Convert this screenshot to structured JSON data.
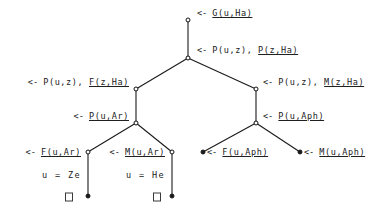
{
  "diagram": {
    "stroke_color": "#1a1a1a",
    "text_color": "#202020",
    "background": "#ffffff",
    "arrow_symbol": "<-",
    "empty_clause_symbol": "box",
    "nodes": [
      {
        "id": "n0",
        "x": 188,
        "y": 20,
        "style": "open",
        "label_side": "right",
        "label_x": 197,
        "label_y": 13,
        "goal_prefix": "<- ",
        "literals": [
          {
            "text": "G(u,Ha)",
            "selected": true
          }
        ]
      },
      {
        "id": "n1",
        "x": 188,
        "y": 58,
        "style": "open",
        "label_side": "right",
        "label_x": 197,
        "label_y": 50,
        "goal_prefix": "<- ",
        "literals": [
          {
            "text": "P(u,z), ",
            "selected": false
          },
          {
            "text": "P(z,Ha)",
            "selected": true
          }
        ]
      },
      {
        "id": "n2",
        "x": 136,
        "y": 89,
        "style": "open",
        "label_side": "left",
        "label_x": 129,
        "label_y": 82,
        "goal_prefix": "<- ",
        "literals": [
          {
            "text": "P(u,z), ",
            "selected": false
          },
          {
            "text": "F(z,Ha)",
            "selected": true
          }
        ]
      },
      {
        "id": "n3",
        "x": 256,
        "y": 89,
        "style": "open",
        "label_side": "right",
        "label_x": 263,
        "label_y": 82,
        "goal_prefix": "<- ",
        "literals": [
          {
            "text": "P(u,z), ",
            "selected": false
          },
          {
            "text": "M(z,Ha)",
            "selected": true
          }
        ]
      },
      {
        "id": "n4",
        "x": 136,
        "y": 123,
        "style": "open",
        "label_side": "left",
        "label_x": 129,
        "label_y": 116,
        "goal_prefix": "<- ",
        "literals": [
          {
            "text": "P(u,Ar)",
            "selected": true
          }
        ]
      },
      {
        "id": "n5",
        "x": 256,
        "y": 123,
        "style": "open",
        "label_side": "right",
        "label_x": 263,
        "label_y": 116,
        "goal_prefix": "<- ",
        "literals": [
          {
            "text": "P(u,Aph)",
            "selected": true
          }
        ]
      },
      {
        "id": "n6",
        "x": 88,
        "y": 152,
        "style": "open",
        "label_side": "left",
        "label_x": 81,
        "label_y": 152,
        "goal_prefix": "<- ",
        "literals": [
          {
            "text": "F(u,Ar)",
            "selected": true
          }
        ]
      },
      {
        "id": "n7",
        "x": 172,
        "y": 152,
        "style": "open",
        "label_side": "left",
        "label_x": 165,
        "label_y": 152,
        "goal_prefix": "<- ",
        "literals": [
          {
            "text": "M(u,Ar)",
            "selected": true
          }
        ]
      },
      {
        "id": "n8",
        "x": 203,
        "y": 152,
        "style": "filled",
        "label_side": "right",
        "label_x": 207,
        "label_y": 152,
        "goal_prefix": "<- ",
        "literals": [
          {
            "text": "F(u,Aph)",
            "selected": true
          }
        ]
      },
      {
        "id": "n9",
        "x": 300,
        "y": 152,
        "style": "filled",
        "label_side": "right",
        "label_x": 304,
        "label_y": 152,
        "goal_prefix": "<- ",
        "literals": [
          {
            "text": "M(u,Aph)",
            "selected": true
          }
        ]
      },
      {
        "id": "n10",
        "x": 88,
        "y": 196,
        "style": "filled",
        "label_side": "none",
        "label_x": 0,
        "label_y": 0,
        "goal_prefix": "",
        "literals": []
      },
      {
        "id": "n11",
        "x": 172,
        "y": 196,
        "style": "filled",
        "label_side": "none",
        "label_x": 0,
        "label_y": 0,
        "goal_prefix": "",
        "literals": []
      }
    ],
    "edges": [
      {
        "from": "n0",
        "to": "n1",
        "x1": 188,
        "y1": 20,
        "x2": 188,
        "y2": 58
      },
      {
        "from": "n1",
        "to": "n2",
        "x1": 188,
        "y1": 58,
        "x2": 136,
        "y2": 89
      },
      {
        "from": "n1",
        "to": "n3",
        "x1": 188,
        "y1": 58,
        "x2": 256,
        "y2": 89
      },
      {
        "from": "n2",
        "to": "n4",
        "x1": 136,
        "y1": 89,
        "x2": 136,
        "y2": 123
      },
      {
        "from": "n3",
        "to": "n5",
        "x1": 256,
        "y1": 89,
        "x2": 256,
        "y2": 123
      },
      {
        "from": "n4",
        "to": "n6",
        "x1": 136,
        "y1": 123,
        "x2": 88,
        "y2": 152
      },
      {
        "from": "n4",
        "to": "n7",
        "x1": 136,
        "y1": 123,
        "x2": 172,
        "y2": 152
      },
      {
        "from": "n5",
        "to": "n8",
        "x1": 256,
        "y1": 123,
        "x2": 203,
        "y2": 152
      },
      {
        "from": "n5",
        "to": "n9",
        "x1": 256,
        "y1": 123,
        "x2": 300,
        "y2": 152
      },
      {
        "from": "n6",
        "to": "n10",
        "x1": 88,
        "y1": 152,
        "x2": 88,
        "y2": 196
      },
      {
        "from": "n7",
        "to": "n11",
        "x1": 172,
        "y1": 152,
        "x2": 172,
        "y2": 196
      }
    ],
    "substitutions": [
      {
        "id": "s0",
        "text": "u = Ze",
        "x": 81,
        "y": 175
      },
      {
        "id": "s1",
        "text": "u = He",
        "x": 165,
        "y": 175
      }
    ],
    "empty_clauses": [
      {
        "id": "b0",
        "x": 69,
        "y": 197
      },
      {
        "id": "b1",
        "x": 157,
        "y": 197
      }
    ]
  }
}
